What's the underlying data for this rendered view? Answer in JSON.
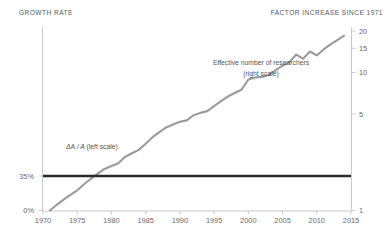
{
  "header": {
    "left_axis_title": "GROWTH RATE",
    "right_axis_title": "FACTOR INCREASE SINCE 1971"
  },
  "annotations": {
    "researchers_line1": "Effective number of researchers",
    "researchers_line2": "(right scale)",
    "growth_formula": "ΔA / A",
    "growth_scale_note": "(left scale)"
  },
  "colors": {
    "researchers_line": "#9a9a9a",
    "growth_line": "#2b2b2b",
    "axis": "#c8c8c8",
    "text": "#555555"
  },
  "chart_data": {
    "type": "line",
    "title": "",
    "xlabel": "",
    "ylabel": "GROWTH RATE",
    "y2label": "FACTOR INCREASE SINCE 1971",
    "grid": false,
    "legend": "inline-annotations",
    "xlim": [
      1969.5,
      2015.5
    ],
    "xticks": [
      1970,
      1975,
      1980,
      1985,
      1990,
      1995,
      2000,
      2005,
      2010,
      2015
    ],
    "xticklabels": [
      "1970",
      "1975",
      "1980",
      "1985",
      "1990",
      "1995",
      "2000",
      "2005",
      "2010",
      "2015"
    ],
    "left_axis": {
      "ticks": [
        0,
        35
      ],
      "ticklabels": [
        "0%",
        "35%"
      ],
      "ylim": [
        0,
        45
      ]
    },
    "right_axis": {
      "scale": "log",
      "ticks": [
        1,
        5,
        10,
        15,
        20
      ],
      "ticklabels": [
        "1",
        "5",
        "10",
        "15",
        "20"
      ],
      "ylim": [
        1,
        20
      ]
    },
    "series": [
      {
        "name": "Effective number of researchers",
        "axis": "right",
        "color": "#9a9a9a",
        "x": [
          1971,
          1972,
          1973,
          1974,
          1975,
          1976,
          1977,
          1978,
          1979,
          1980,
          1981,
          1982,
          1983,
          1984,
          1985,
          1986,
          1987,
          1988,
          1989,
          1990,
          1991,
          1992,
          1993,
          1994,
          1995,
          1996,
          1997,
          1998,
          1999,
          2000,
          2001,
          2002,
          2003,
          2004,
          2005,
          2006,
          2007,
          2008,
          2009,
          2010,
          2011,
          2012,
          2013,
          2014
        ],
        "values": [
          1.0,
          1.1,
          1.2,
          1.3,
          1.4,
          1.55,
          1.7,
          1.85,
          2.0,
          2.1,
          2.2,
          2.45,
          2.6,
          2.75,
          3.05,
          3.4,
          3.7,
          4.0,
          4.2,
          4.4,
          4.5,
          4.9,
          5.1,
          5.25,
          5.7,
          6.2,
          6.7,
          7.1,
          7.5,
          8.9,
          9.2,
          9.3,
          9.6,
          10.4,
          11.2,
          11.9,
          13.5,
          12.6,
          14.2,
          13.3,
          14.7,
          16.0,
          17.2,
          18.5
        ]
      },
      {
        "name": "ΔA / A",
        "axis": "left",
        "color": "#2b2b2b",
        "x": [
          1970,
          2015
        ],
        "values": [
          35,
          35
        ],
        "note": "constant growth rate line at 35% on left scale"
      }
    ]
  }
}
